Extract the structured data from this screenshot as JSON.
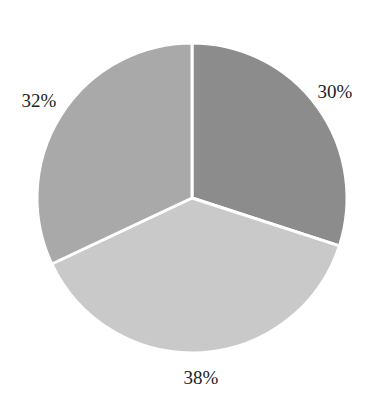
{
  "chart_data": {
    "type": "pie",
    "title": "",
    "start_angle_deg": 0,
    "direction": "clockwise",
    "slices": [
      {
        "label": "30%",
        "value": 30,
        "color": "#8c8c8c",
        "label_pos": [
          335,
          98
        ]
      },
      {
        "label": "38%",
        "value": 38,
        "color": "#c9c9c9",
        "label_pos": [
          201,
          384
        ]
      },
      {
        "label": "32%",
        "value": 32,
        "color": "#a9a9a9",
        "label_pos": [
          39,
          107
        ]
      }
    ],
    "legend": null,
    "separator_color": "#ffffff"
  }
}
